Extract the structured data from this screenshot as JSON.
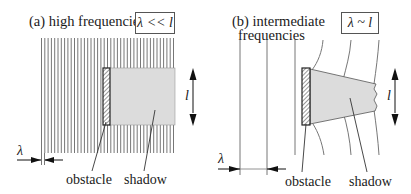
{
  "panel_a": {
    "title": "(a) high frequencies",
    "condition": "λ << l",
    "obstacle_label": "obstacle",
    "shadow_label": "shadow",
    "wavelength_symbol": "λ",
    "length_symbol": "l"
  },
  "panel_b": {
    "title_line1": "(b) intermediate",
    "title_line2": "frequencies",
    "condition": "λ ~ l",
    "obstacle_label": "obstacle",
    "shadow_label": "shadow",
    "wavelength_symbol": "λ",
    "length_symbol": "l"
  },
  "colors": {
    "wavefront": "#777777",
    "shadow_fill": "#dcdcdc",
    "obstacle_outline": "#222222",
    "text": "#1a1a1a"
  }
}
